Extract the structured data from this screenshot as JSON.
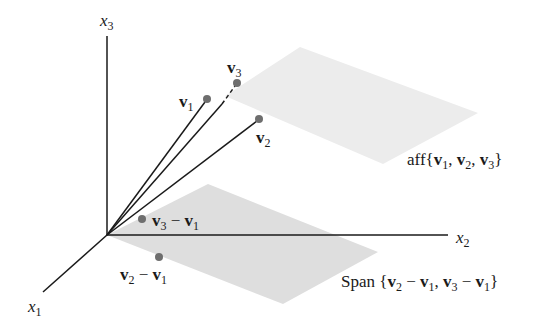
{
  "figure": {
    "colors": {
      "axis": "#1a1a1a",
      "vector_line": "#1a1a1a",
      "point": "#6e6e6e",
      "aff_plane": "#ececec",
      "span_plane": "#dedede",
      "background": "#ffffff"
    },
    "origin": [
      107,
      235
    ],
    "axes": {
      "x1": {
        "name": "x",
        "sub": "1",
        "end": [
          43,
          292
        ]
      },
      "x2": {
        "name": "x",
        "sub": "2",
        "end": [
          448,
          235
        ]
      },
      "x3": {
        "name": "x",
        "sub": "3",
        "end": [
          107,
          36
        ]
      }
    },
    "points": {
      "v1": {
        "name": "v",
        "sub": "1",
        "pos": [
          207,
          99
        ]
      },
      "v2": {
        "name": "v",
        "sub": "2",
        "pos": [
          259,
          119
        ]
      },
      "v3": {
        "name": "v",
        "sub": "3",
        "pos": [
          237,
          83
        ]
      },
      "v3_minus_v1": {
        "a": "v",
        "a_sub": "3",
        "op": "−",
        "b": "v",
        "b_sub": "1",
        "pos": [
          142,
          219
        ]
      },
      "v2_minus_v1": {
        "a": "v",
        "a_sub": "2",
        "op": "−",
        "b": "v",
        "b_sub": "1",
        "pos": [
          159,
          257
        ]
      }
    },
    "planes": {
      "aff": {
        "prefix": "aff",
        "open": "{",
        "items": [
          {
            "name": "v",
            "sub": "1"
          },
          {
            "name": "v",
            "sub": "2"
          },
          {
            "name": "v",
            "sub": "3"
          }
        ],
        "sep": ",",
        "close": "}",
        "polygon": "225,96 300,47 478,113 383,164"
      },
      "span": {
        "prefix": "Span",
        "open": "{",
        "items": [
          {
            "a": "v",
            "a_sub": "2",
            "op": "−",
            "b": "v",
            "b_sub": "1"
          },
          {
            "a": "v",
            "a_sub": "3",
            "op": "−",
            "b": "v",
            "b_sub": "1"
          }
        ],
        "sep": ",",
        "close": "}",
        "polygon": "107,235 208,184 378,252 283,304"
      }
    }
  }
}
